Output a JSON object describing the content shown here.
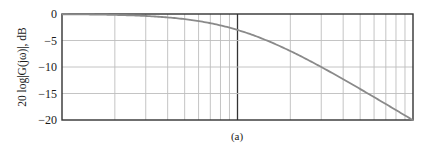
{
  "chart_data": {
    "type": "line",
    "title": "",
    "caption": "(a)",
    "xlabel": "",
    "ylabel": "20 log|G(jω)|, dB",
    "xscale": "log",
    "xlim": [
      0.1,
      10
    ],
    "ylim": [
      -20,
      0
    ],
    "yticks": [
      0,
      -5,
      -10,
      -15,
      -20
    ],
    "ytick_labels": [
      "0",
      "−5",
      "−10",
      "−15",
      "−20"
    ],
    "grid": true,
    "legend": null,
    "series": [
      {
        "name": "20 log|G(jω)|",
        "x": [
          0.1,
          0.2,
          0.3,
          0.5,
          0.7,
          1.0,
          1.5,
          2.0,
          3.0,
          5.0,
          7.0,
          10.0
        ],
        "y": [
          -0.04,
          -0.17,
          -0.37,
          -0.97,
          -1.74,
          -3.01,
          -5.12,
          -6.99,
          -10.0,
          -14.15,
          -17.0,
          -20.04
        ]
      }
    ]
  },
  "colors": {
    "curve": "#8a8a8a",
    "frame": "#333333",
    "grid": "#bdbdbd",
    "decade_line": "#333333"
  }
}
